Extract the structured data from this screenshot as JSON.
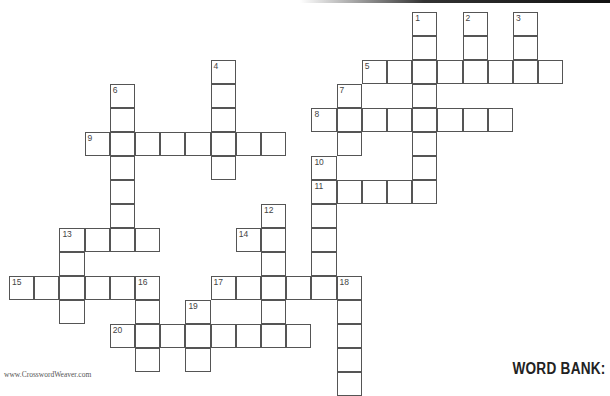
{
  "grid": {
    "origin_x": 9,
    "origin_y": 12,
    "cell_w": 25.2,
    "cell_h": 24,
    "words": [
      {
        "number": "1",
        "dir": "down",
        "row": 0,
        "col": 16,
        "length": 8
      },
      {
        "number": "2",
        "dir": "down",
        "row": 0,
        "col": 18,
        "length": 3
      },
      {
        "number": "3",
        "dir": "down",
        "row": 0,
        "col": 20,
        "length": 3
      },
      {
        "number": "4",
        "dir": "down",
        "row": 2,
        "col": 8,
        "length": 5
      },
      {
        "number": "5",
        "dir": "across",
        "row": 2,
        "col": 14,
        "length": 8
      },
      {
        "number": "6",
        "dir": "down",
        "row": 3,
        "col": 4,
        "length": 7
      },
      {
        "number": "7",
        "dir": "down",
        "row": 3,
        "col": 13,
        "length": 3
      },
      {
        "number": "8",
        "dir": "across",
        "row": 4,
        "col": 12,
        "length": 8
      },
      {
        "number": "9",
        "dir": "across",
        "row": 5,
        "col": 3,
        "length": 8
      },
      {
        "number": "10",
        "dir": "down",
        "row": 6,
        "col": 12,
        "length": 6
      },
      {
        "number": "11",
        "dir": "across",
        "row": 7,
        "col": 12,
        "length": 5
      },
      {
        "number": "12",
        "dir": "down",
        "row": 8,
        "col": 10,
        "length": 6
      },
      {
        "number": "13",
        "dir": "across",
        "row": 9,
        "col": 2,
        "length": 4
      },
      {
        "number": "13d",
        "label": "",
        "dir": "down",
        "row": 9,
        "col": 2,
        "length": 4
      },
      {
        "number": "14",
        "dir": "across",
        "row": 9,
        "col": 9,
        "length": 2
      },
      {
        "number": "15",
        "dir": "across",
        "row": 11,
        "col": 0,
        "length": 6
      },
      {
        "number": "16",
        "dir": "down",
        "row": 11,
        "col": 5,
        "length": 4
      },
      {
        "number": "17",
        "dir": "across",
        "row": 11,
        "col": 8,
        "length": 6
      },
      {
        "number": "18",
        "dir": "down",
        "row": 11,
        "col": 13,
        "length": 5
      },
      {
        "number": "19",
        "dir": "down",
        "row": 12,
        "col": 7,
        "length": 3
      },
      {
        "number": "20",
        "dir": "across",
        "row": 13,
        "col": 4,
        "length": 8
      }
    ]
  },
  "footer": {
    "credit": "www.CrosswordWeaver.com"
  },
  "word_bank": {
    "title": "WORD BANK:"
  }
}
